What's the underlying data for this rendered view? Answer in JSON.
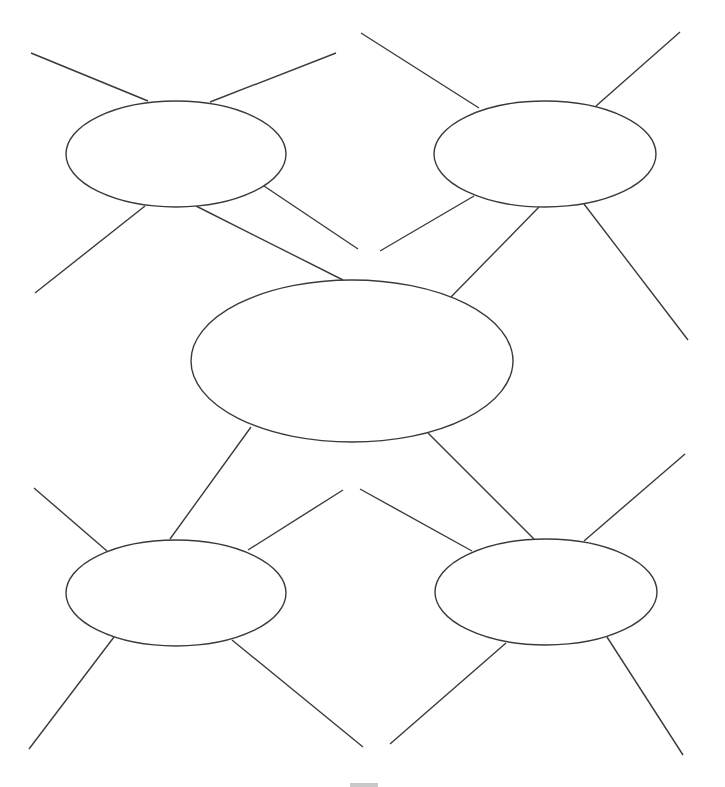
{
  "diagram": {
    "type": "mind-map graphic organizer (blank)",
    "stroke_color": "#3a3a3a",
    "fill_color": "#ffffff",
    "stroke_width": 1.4,
    "nodes": [
      {
        "id": "top-left",
        "cx": 176,
        "cy": 154,
        "rx": 110,
        "ry": 53,
        "label": ""
      },
      {
        "id": "top-right",
        "cx": 545,
        "cy": 154,
        "rx": 111,
        "ry": 53,
        "label": ""
      },
      {
        "id": "center",
        "cx": 352,
        "cy": 361,
        "rx": 161,
        "ry": 81,
        "label": ""
      },
      {
        "id": "bottom-left",
        "cx": 176,
        "cy": 593,
        "rx": 110,
        "ry": 53,
        "label": ""
      },
      {
        "id": "bottom-right",
        "cx": 546,
        "cy": 592,
        "rx": 111,
        "ry": 53,
        "label": ""
      }
    ],
    "lines": [
      {
        "node": "top-left",
        "x1": 31,
        "y1": 53,
        "x2": 148,
        "y2": 101
      },
      {
        "node": "top-left",
        "x1": 336,
        "y1": 53,
        "x2": 210,
        "y2": 102
      },
      {
        "node": "top-left",
        "x1": 145,
        "y1": 206,
        "x2": 35,
        "y2": 293
      },
      {
        "node": "top-left",
        "x1": 196,
        "y1": 206,
        "x2": 343,
        "y2": 280
      },
      {
        "node": "top-left",
        "x1": 264,
        "y1": 186,
        "x2": 358,
        "y2": 249
      },
      {
        "node": "top-right",
        "x1": 361,
        "y1": 33,
        "x2": 479,
        "y2": 108
      },
      {
        "node": "top-right",
        "x1": 680,
        "y1": 32,
        "x2": 596,
        "y2": 106
      },
      {
        "node": "top-right",
        "x1": 474,
        "y1": 196,
        "x2": 380,
        "y2": 251
      },
      {
        "node": "top-right",
        "x1": 539,
        "y1": 207,
        "x2": 451,
        "y2": 297
      },
      {
        "node": "top-right",
        "x1": 584,
        "y1": 204,
        "x2": 688,
        "y2": 340
      },
      {
        "node": "bottom-left",
        "x1": 251,
        "y1": 427,
        "x2": 170,
        "y2": 539
      },
      {
        "node": "bottom-left",
        "x1": 34,
        "y1": 488,
        "x2": 107,
        "y2": 551
      },
      {
        "node": "bottom-left",
        "x1": 343,
        "y1": 490,
        "x2": 248,
        "y2": 550
      },
      {
        "node": "bottom-left",
        "x1": 114,
        "y1": 637,
        "x2": 29,
        "y2": 749
      },
      {
        "node": "bottom-left",
        "x1": 232,
        "y1": 640,
        "x2": 363,
        "y2": 747
      },
      {
        "node": "bottom-right",
        "x1": 428,
        "y1": 433,
        "x2": 534,
        "y2": 539
      },
      {
        "node": "bottom-right",
        "x1": 360,
        "y1": 489,
        "x2": 472,
        "y2": 551
      },
      {
        "node": "bottom-right",
        "x1": 685,
        "y1": 454,
        "x2": 584,
        "y2": 541
      },
      {
        "node": "bottom-right",
        "x1": 506,
        "y1": 643,
        "x2": 390,
        "y2": 744
      },
      {
        "node": "bottom-right",
        "x1": 607,
        "y1": 637,
        "x2": 683,
        "y2": 755
      }
    ],
    "footer_bar": {
      "x": 350,
      "y": 783,
      "width": 28,
      "height": 4,
      "color": "#c8c8c8"
    }
  }
}
